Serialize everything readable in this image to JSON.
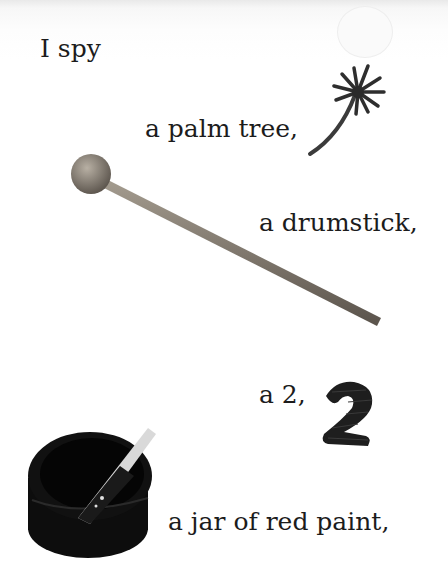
{
  "page": {
    "lines": [
      "I spy",
      "a palm tree,",
      "a drumstick,",
      "a 2,",
      "a jar of red paint,"
    ]
  },
  "pictures": [
    {
      "name": "palm-tree",
      "desc": "small palm tree"
    },
    {
      "name": "drumstick",
      "desc": "wooden drumstick with round head"
    },
    {
      "name": "number-two",
      "desc": "dark foam number 2"
    },
    {
      "name": "paint-jar",
      "desc": "open jar of red paint with stir stick"
    }
  ]
}
